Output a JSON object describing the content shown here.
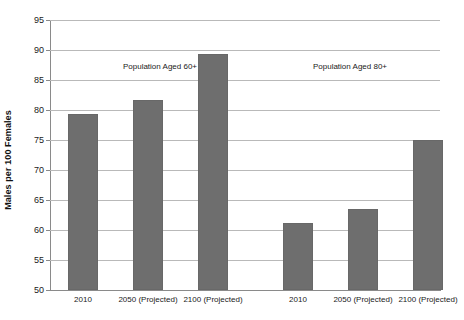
{
  "chart_data": {
    "type": "bar",
    "title": "",
    "subtitle": "",
    "xlabel": "",
    "ylabel": "Males per 100 Females",
    "ylim": [
      50,
      95
    ],
    "y_ticks": [
      50,
      55,
      60,
      65,
      70,
      75,
      80,
      85,
      90,
      95
    ],
    "grid": true,
    "legend": "none",
    "bar_color": "#6e6e6e",
    "gridline_color": "#b9b9b9",
    "axis_color": "#8a8a8a",
    "categories": [
      "2010",
      "2050 (Projected)",
      "2100 (Projected)",
      "2010",
      "2050 (Projected)",
      "2100 (Projected)"
    ],
    "values": [
      79.3,
      81.6,
      89.4,
      61.2,
      63.5,
      75.0
    ],
    "groups": [
      {
        "label": "Population Aged 60+",
        "categories": [
          "2010",
          "2050 (Projected)",
          "2100 (Projected)"
        ],
        "values": [
          79.3,
          81.6,
          89.4
        ]
      },
      {
        "label": "Population Aged 80+",
        "categories": [
          "2010",
          "2050 (Projected)",
          "2100 (Projected)"
        ],
        "values": [
          61.2,
          63.5,
          75.0
        ]
      }
    ],
    "annotations": [
      {
        "text": "Population Aged 60+",
        "x_px": 160,
        "y_px": 62
      },
      {
        "text": "Population Aged 80+",
        "x_px": 350,
        "y_px": 62
      }
    ]
  }
}
